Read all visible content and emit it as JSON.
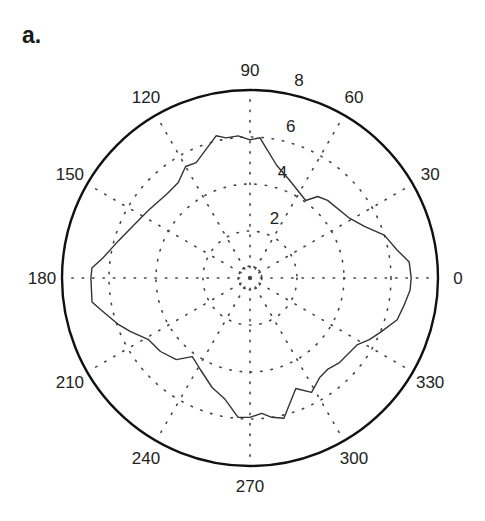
{
  "panel_label": "a.",
  "chart_data": {
    "type": "polar-line",
    "title": "",
    "panel": "a.",
    "rlim": [
      0,
      8
    ],
    "r_ticks": [
      2,
      4,
      6,
      8
    ],
    "r_tick_labels": [
      "2",
      "4",
      "6",
      "8"
    ],
    "r_label_angle_deg": 80,
    "theta_ticks_deg": [
      0,
      30,
      60,
      90,
      120,
      150,
      180,
      210,
      240,
      270,
      300,
      330
    ],
    "theta_tick_labels": [
      "0",
      "30",
      "60",
      "90",
      "120",
      "150",
      "180",
      "210",
      "240",
      "270",
      "300",
      "330"
    ],
    "grid": "dotted",
    "inner_grid_circle_r": 0.5,
    "line_color": "#333333",
    "outer_circle_color": "#111111",
    "series": [
      {
        "name": "profile",
        "theta_deg": [
          0,
          5.7,
          10.7,
          17.7,
          24.3,
          31,
          45,
          50.3,
          54.3,
          67.8,
          76.6,
          83.6,
          85.9,
          90,
          94.8,
          99.7,
          103.4,
          115,
          120,
          126.9,
          134.3,
          146.3,
          152.6,
          164,
          172.3,
          176.4,
          180,
          188.6,
          192,
          199.6,
          204.2,
          211.3,
          219.4,
          227.9,
          233.7,
          241.5,
          250.9,
          258.4,
          265.1,
          270,
          275,
          278.9,
          283.6,
          292.5,
          298.3,
          305,
          310.3,
          316.6,
          328.2,
          332.7,
          337.8,
          344.2,
          350.1,
          355.7,
          360
        ],
        "r": [
          6.86,
          6.81,
          6.38,
          6.0,
          5.34,
          4.94,
          4.67,
          4.51,
          4.06,
          4.48,
          4.92,
          5.66,
          5.98,
          5.88,
          6.07,
          6.05,
          6.22,
          5.42,
          5.48,
          5.08,
          5.03,
          5.19,
          5.34,
          5.81,
          6.32,
          6.74,
          6.77,
          6.8,
          6.49,
          5.93,
          5.57,
          5.05,
          4.93,
          4.68,
          4.15,
          4.43,
          4.93,
          5.27,
          5.95,
          5.93,
          5.78,
          6.0,
          6.14,
          5.09,
          5.53,
          5.17,
          5.1,
          5.24,
          5.38,
          5.72,
          6.04,
          6.51,
          6.66,
          6.83,
          6.86
        ]
      }
    ]
  }
}
